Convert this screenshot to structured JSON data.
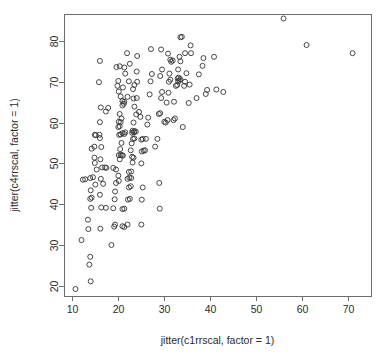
{
  "chart_data": {
    "type": "scatter",
    "title": "",
    "subtitle": "",
    "xlabel": "jitter(c1rrscal, factor = 1)",
    "ylabel": "jitter(c4rrscal, factor = 1)",
    "xlim": [
      8.3,
      75.0
    ],
    "ylim": [
      17.5,
      86.6
    ],
    "xticks": [
      10,
      20,
      30,
      40,
      50,
      60,
      70
    ],
    "yticks": [
      20,
      30,
      40,
      50,
      60,
      70,
      80
    ],
    "xtick_labels": [
      "10",
      "20",
      "30",
      "40",
      "50",
      "60",
      "70"
    ],
    "ytick_labels": [
      "20",
      "30",
      "40",
      "50",
      "60",
      "70",
      "80"
    ],
    "grid": false,
    "legend": null,
    "legend_position": "none",
    "marker": "open-circle",
    "marker_size_px": 5,
    "marker_stroke_color": "#333333",
    "frame_color": "#6e6e6e",
    "background_color": "#ffffff",
    "n_points": 201,
    "series": [
      {
        "name": "c1rrscal vs c4rrscal",
        "points": [
          [
            10.8,
            19.2
          ],
          [
            12.1,
            31.2
          ],
          [
            13.8,
            25.2
          ],
          [
            14.0,
            27.1
          ],
          [
            14.1,
            21.1
          ],
          [
            13.6,
            33.9
          ],
          [
            13.5,
            36.2
          ],
          [
            14.2,
            39.1
          ],
          [
            14.0,
            41.3
          ],
          [
            14.3,
            41.6
          ],
          [
            14.1,
            43.4
          ],
          [
            12.4,
            46.0
          ],
          [
            12.9,
            46.1
          ],
          [
            14.0,
            46.4
          ],
          [
            14.6,
            46.6
          ],
          [
            15.1,
            44.8
          ],
          [
            15.4,
            48.5
          ],
          [
            15.0,
            50.1
          ],
          [
            14.9,
            51.4
          ],
          [
            14.3,
            53.6
          ],
          [
            14.9,
            54.1
          ],
          [
            15.2,
            56.9
          ],
          [
            15.0,
            57.0
          ],
          [
            16.0,
            57.0
          ],
          [
            16.1,
            56.2
          ],
          [
            16.4,
            54.0
          ],
          [
            16.2,
            51.0
          ],
          [
            16.6,
            49.0
          ],
          [
            17.2,
            49.0
          ],
          [
            17.5,
            48.9
          ],
          [
            16.3,
            46.2
          ],
          [
            16.8,
            45.0
          ],
          [
            16.1,
            42.3
          ],
          [
            16.4,
            39.2
          ],
          [
            17.4,
            39.1
          ],
          [
            16.2,
            34.0
          ],
          [
            16.1,
            60.1
          ],
          [
            16.3,
            63.7
          ],
          [
            15.9,
            69.9
          ],
          [
            16.1,
            75.1
          ],
          [
            17.4,
            62.7
          ],
          [
            17.9,
            63.6
          ],
          [
            18.6,
            30.0
          ],
          [
            19.2,
            34.5
          ],
          [
            19.4,
            35.0
          ],
          [
            19.0,
            39.0
          ],
          [
            19.3,
            41.2
          ],
          [
            19.4,
            43.1
          ],
          [
            19.6,
            45.2
          ],
          [
            19.0,
            48.9
          ],
          [
            19.6,
            48.5
          ],
          [
            20.1,
            47.0
          ],
          [
            20.2,
            45.7
          ],
          [
            20.4,
            51.0
          ],
          [
            20.2,
            52.0
          ],
          [
            20.6,
            52.1
          ],
          [
            20.9,
            52.0
          ],
          [
            21.1,
            51.9
          ],
          [
            20.5,
            53.5
          ],
          [
            20.8,
            55.0
          ],
          [
            20.3,
            57.0
          ],
          [
            20.6,
            57.1
          ],
          [
            21.0,
            57.4
          ],
          [
            21.4,
            57.2
          ],
          [
            21.6,
            57.6
          ],
          [
            20.1,
            58.9
          ],
          [
            20.4,
            59.1
          ],
          [
            20.2,
            60.2
          ],
          [
            20.6,
            60.1
          ],
          [
            20.8,
            61.0
          ],
          [
            20.4,
            62.1
          ],
          [
            21.0,
            64.2
          ],
          [
            21.3,
            64.6
          ],
          [
            21.0,
            65.3
          ],
          [
            21.4,
            65.1
          ],
          [
            20.6,
            66.4
          ],
          [
            20.2,
            67.6
          ],
          [
            19.9,
            69.0
          ],
          [
            20.1,
            70.2
          ],
          [
            19.7,
            73.6
          ],
          [
            20.4,
            73.8
          ],
          [
            21.4,
            73.5
          ],
          [
            21.6,
            72.0
          ],
          [
            21.1,
            68.6
          ],
          [
            22.1,
            66.3
          ],
          [
            22.4,
            70.1
          ],
          [
            22.0,
            77.0
          ],
          [
            22.6,
            74.4
          ],
          [
            21.0,
            38.8
          ],
          [
            21.4,
            38.9
          ],
          [
            21.0,
            34.6
          ],
          [
            21.4,
            34.4
          ],
          [
            22.1,
            35.0
          ],
          [
            22.2,
            41.1
          ],
          [
            22.6,
            41.3
          ],
          [
            22.4,
            44.1
          ],
          [
            22.8,
            44.4
          ],
          [
            22.1,
            46.2
          ],
          [
            22.5,
            46.5
          ],
          [
            22.9,
            46.4
          ],
          [
            22.4,
            47.9
          ],
          [
            22.9,
            48.0
          ],
          [
            23.2,
            50.2
          ],
          [
            23.1,
            51.6
          ],
          [
            23.4,
            51.4
          ],
          [
            22.8,
            53.2
          ],
          [
            23.0,
            54.9
          ],
          [
            23.3,
            56.0
          ],
          [
            23.6,
            56.1
          ],
          [
            23.1,
            57.5
          ],
          [
            23.5,
            57.6
          ],
          [
            23.2,
            58.0
          ],
          [
            23.6,
            57.9
          ],
          [
            23.9,
            57.8
          ],
          [
            23.4,
            60.0
          ],
          [
            24.0,
            62.0
          ],
          [
            23.6,
            63.9
          ],
          [
            23.4,
            65.9
          ],
          [
            24.1,
            66.0
          ],
          [
            23.3,
            68.2
          ],
          [
            23.6,
            69.2
          ],
          [
            24.2,
            70.0
          ],
          [
            24.1,
            72.5
          ],
          [
            24.2,
            76.3
          ],
          [
            24.6,
            62.6
          ],
          [
            24.9,
            61.4
          ],
          [
            25.1,
            55.8
          ],
          [
            25.4,
            56.0
          ],
          [
            25.2,
            52.9
          ],
          [
            25.6,
            53.1
          ],
          [
            25.9,
            53.2
          ],
          [
            25.1,
            50.0
          ],
          [
            25.4,
            44.1
          ],
          [
            25.2,
            41.1
          ],
          [
            25.1,
            35.0
          ],
          [
            26.1,
            56.0
          ],
          [
            26.4,
            59.5
          ],
          [
            26.6,
            61.2
          ],
          [
            26.9,
            66.9
          ],
          [
            27.1,
            70.1
          ],
          [
            27.4,
            71.9
          ],
          [
            27.2,
            78.0
          ],
          [
            28.1,
            54.1
          ],
          [
            28.6,
            56.0
          ],
          [
            29.0,
            45.2
          ],
          [
            29.1,
            38.9
          ],
          [
            28.9,
            62.1
          ],
          [
            29.2,
            62.3
          ],
          [
            29.4,
            66.0
          ],
          [
            29.6,
            67.5
          ],
          [
            29.2,
            71.4
          ],
          [
            29.6,
            73.0
          ],
          [
            29.4,
            77.9
          ],
          [
            30.1,
            60.2
          ],
          [
            30.4,
            60.0
          ],
          [
            30.8,
            60.6
          ],
          [
            30.6,
            64.9
          ],
          [
            31.0,
            67.3
          ],
          [
            31.1,
            70.0
          ],
          [
            31.4,
            70.5
          ],
          [
            31.2,
            72.0
          ],
          [
            31.6,
            74.9
          ],
          [
            31.9,
            75.2
          ],
          [
            31.4,
            75.4
          ],
          [
            30.9,
            76.9
          ],
          [
            32.1,
            60.6
          ],
          [
            32.4,
            61.0
          ],
          [
            32.2,
            65.1
          ],
          [
            32.6,
            69.0
          ],
          [
            32.9,
            69.2
          ],
          [
            33.1,
            70.1
          ],
          [
            33.4,
            70.3
          ],
          [
            33.0,
            70.8
          ],
          [
            33.6,
            70.6
          ],
          [
            33.2,
            71.0
          ],
          [
            33.1,
            73.0
          ],
          [
            33.6,
            75.0
          ],
          [
            33.4,
            76.1
          ],
          [
            33.6,
            80.9
          ],
          [
            33.9,
            81.0
          ],
          [
            34.1,
            58.9
          ],
          [
            34.4,
            69.0
          ],
          [
            34.6,
            70.0
          ],
          [
            34.9,
            72.1
          ],
          [
            34.6,
            77.0
          ],
          [
            35.4,
            64.8
          ],
          [
            35.6,
            69.3
          ],
          [
            35.9,
            77.0
          ],
          [
            35.8,
            78.9
          ],
          [
            37.1,
            66.0
          ],
          [
            37.6,
            71.8
          ],
          [
            38.4,
            73.9
          ],
          [
            38.6,
            75.8
          ],
          [
            39.1,
            67.0
          ],
          [
            39.4,
            68.0
          ],
          [
            40.9,
            76.1
          ],
          [
            41.4,
            68.1
          ],
          [
            42.9,
            67.5
          ],
          [
            56.0,
            85.5
          ],
          [
            61.0,
            79.0
          ],
          [
            71.0,
            77.0
          ]
        ]
      }
    ]
  },
  "geometry": {
    "plot_left_px": 64,
    "plot_right_px": 371,
    "plot_top_px": 14,
    "plot_bottom_px": 296,
    "xaxis_title_y_px": 341,
    "yaxis_title_x_px": 18
  }
}
